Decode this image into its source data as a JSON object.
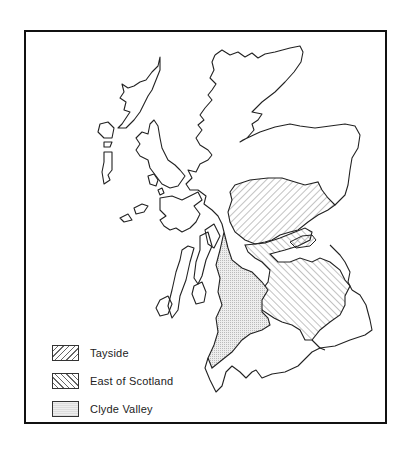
{
  "map": {
    "subject": "Scotland regions",
    "colors": {
      "outline": "#222222",
      "hatch": "#666666",
      "stipple": "#e4e4e4",
      "background": "#ffffff"
    }
  },
  "legend": {
    "items": [
      {
        "label": "Tayside",
        "pattern": "diagonal-hatch-forward"
      },
      {
        "label": "East of Scotland",
        "pattern": "diagonal-hatch-backward"
      },
      {
        "label": "Clyde Valley",
        "pattern": "stipple"
      }
    ]
  }
}
